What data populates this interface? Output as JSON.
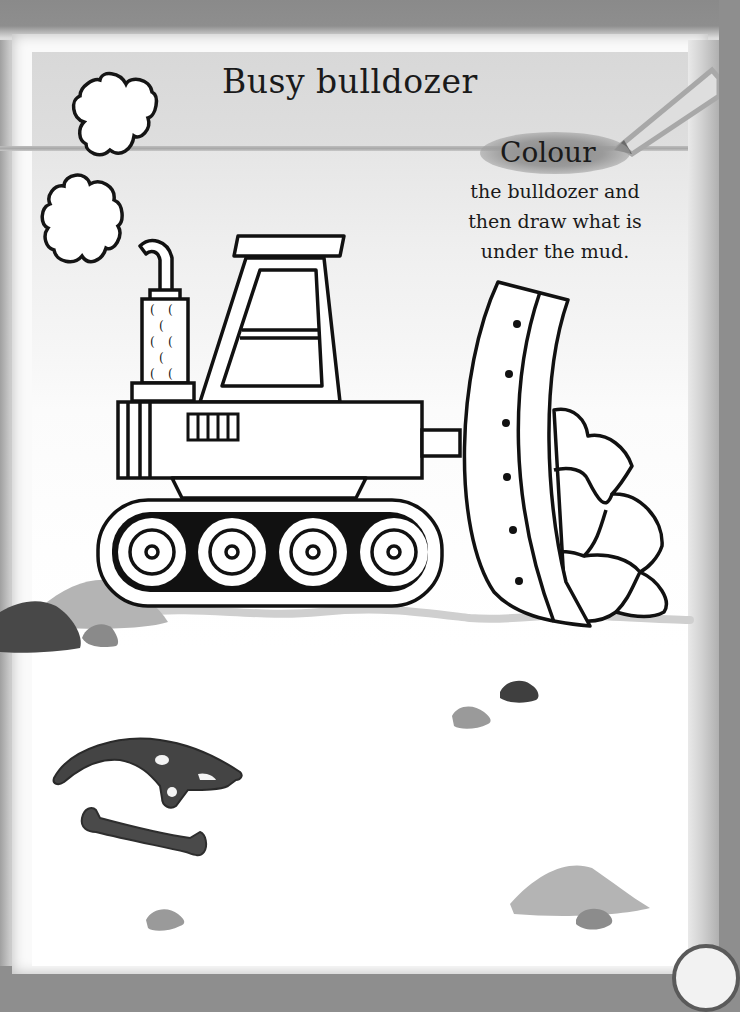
{
  "page": {
    "title": "Busy bulldozer",
    "instruction": {
      "highlight": "Colour",
      "lines": [
        "the bulldozer and",
        "then draw what is",
        "under the mud."
      ]
    }
  },
  "illustration": {
    "subject": "bulldozer",
    "smoke_clouds": 2,
    "wheels": 4,
    "blade_rivets": 6,
    "exhaust_holes": 8,
    "grill_slats": 5,
    "rocks_in_blade": 5,
    "fossils": [
      "dinosaur-skull",
      "bone"
    ],
    "mud_mounds": 6
  },
  "colors": {
    "ink": "#111111",
    "dark_mud": "#4a4a4a",
    "mid_mud": "#8c8c8c",
    "light_mud": "#b4b4b4",
    "fossil": "#3d3d3d",
    "pencil": "#b0b0b0"
  }
}
